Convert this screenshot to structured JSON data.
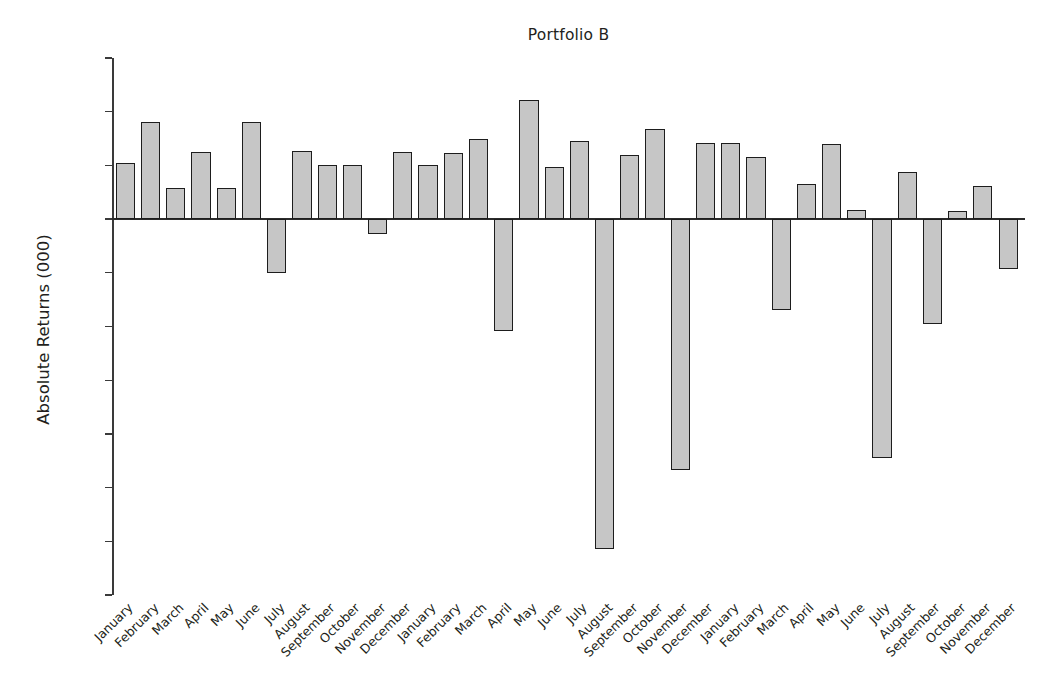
{
  "chart_data": {
    "type": "bar",
    "title": "Portfolio B",
    "xlabel": "",
    "ylabel": "Absolute Returns (000)",
    "ylim": [
      -1400,
      600
    ],
    "ytick_step": 200,
    "yticks": [
      600,
      400,
      200,
      0,
      -200,
      -400,
      -600,
      -800,
      -1000,
      -1200,
      -1400
    ],
    "ytick_labels": [
      "600",
      "400",
      "200",
      "0",
      "−200",
      "−400",
      "−600",
      "−800",
      "−1000",
      "−1200",
      "−1400"
    ],
    "grid": false,
    "legend": false,
    "bar_fill": "#c6c6c6",
    "bar_edge": "#1d1d1d",
    "categories": [
      "January",
      "February",
      "March",
      "April",
      "May",
      "June",
      "July",
      "August",
      "September",
      "October",
      "November",
      "December",
      "January",
      "February",
      "March",
      "April",
      "May",
      "June",
      "July",
      "August",
      "September",
      "October",
      "November",
      "December",
      "January",
      "February",
      "March",
      "April",
      "May",
      "June",
      "July",
      "August",
      "September",
      "October",
      "November",
      "December"
    ],
    "values": [
      210,
      360,
      115,
      250,
      115,
      360,
      -200,
      255,
      200,
      200,
      -55,
      250,
      200,
      245,
      300,
      -415,
      445,
      195,
      290,
      -1230,
      240,
      337,
      -935,
      285,
      285,
      230,
      -340,
      130,
      280,
      35,
      -890,
      175,
      -390,
      30,
      125,
      -185
    ],
    "values_unit": "thousands"
  },
  "figure": {
    "background": "#ffffff"
  }
}
